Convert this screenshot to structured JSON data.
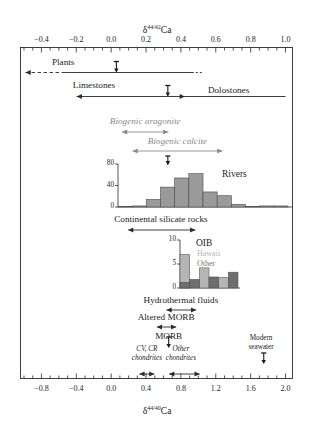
{
  "figure": {
    "top_axis": {
      "title_delta": "δ",
      "title_sup": "44/42",
      "title_elem": "Ca",
      "ticks": [
        "-0.4",
        "-0.2",
        "0.0",
        "0.2",
        "0.4",
        "0.6",
        "0.8",
        "1.0"
      ],
      "tick_values": [
        -0.4,
        -0.2,
        0.0,
        0.2,
        0.4,
        0.6,
        0.8,
        1.0
      ],
      "range": [
        -0.52,
        1.04
      ],
      "minor_per_major": 4
    },
    "bottom_axis": {
      "title_delta": "δ",
      "title_sup": "44/40",
      "title_elem": "Ca",
      "ticks": [
        "-0.8",
        "-0.4",
        "0.0",
        "0.4",
        "0.8",
        "1.2",
        "1.6",
        "2.0"
      ],
      "tick_values": [
        -0.8,
        -0.4,
        0.0,
        0.4,
        0.8,
        1.2,
        1.6,
        2.0
      ],
      "range": [
        -1.04,
        2.08
      ],
      "minor_per_major": 4
    },
    "bars": [
      {
        "name": "plants",
        "label": "Plants",
        "label_x": -0.34,
        "label_align": "left",
        "start": -0.52,
        "end": 0.52,
        "dashed_left": true,
        "arrow_left": true,
        "arrow_right": false,
        "marker": 0.03,
        "style": "plain",
        "italic": false
      },
      {
        "name": "limestones",
        "label": "Limestones",
        "label_x": -0.22,
        "label_align": "left",
        "start": -0.215,
        "end": 0.44,
        "arrow_left": true,
        "arrow_right": true,
        "marker": 0.325,
        "style": "plain",
        "italic": false
      },
      {
        "name": "dolostones",
        "label": "Dolostones",
        "label_x": 0.555,
        "label_align": "left",
        "start": 0.395,
        "end": 1.0,
        "arrow_left": false,
        "arrow_right": false,
        "style": "plain",
        "italic": false
      },
      {
        "name": "biogenic-aragonite",
        "label": "Biogenic aragonite",
        "label_x": 0.195,
        "label_align": "center",
        "start": 0.045,
        "end": 0.345,
        "arrow_left": true,
        "arrow_right": true,
        "style": "grey",
        "italic": true
      },
      {
        "name": "biogenic-calcite",
        "label": "Biogenic calcite",
        "label_x": 0.38,
        "label_align": "center",
        "start": 0.105,
        "end": 0.655,
        "arrow_left": true,
        "arrow_right": true,
        "style": "grey",
        "italic": true
      },
      {
        "name": "continental-silicate-rocks",
        "label": "Continental silicate rocks",
        "label_x": 0.285,
        "label_align": "center",
        "start": 0.08,
        "end": 0.5,
        "arrow_left": true,
        "arrow_right": true,
        "style": "plain",
        "italic": false
      },
      {
        "name": "hydrothermal-fluids",
        "label": "Hydrothermal fluids",
        "label_x": 0.4,
        "label_align": "center",
        "start": 0.3,
        "end": 0.505,
        "arrow_left": true,
        "arrow_right": true,
        "style": "plain",
        "italic": false
      },
      {
        "name": "altered-morb",
        "label": "Altered MORB",
        "label_x": 0.315,
        "label_align": "center",
        "start": 0.245,
        "end": 0.39,
        "arrow_left": true,
        "arrow_right": true,
        "style": "plain",
        "italic": false
      },
      {
        "name": "morb",
        "label": "MORB",
        "label_x": 0.33,
        "label_align": "center",
        "marker": 0.33,
        "style": "marker-only",
        "italic": false
      },
      {
        "name": "modern-seawater",
        "label": "Modern\nseawater",
        "label_x": 0.86,
        "label_align": "center",
        "marker": 0.875,
        "style": "marker-only",
        "italic": false
      },
      {
        "name": "cv-cr-chondrites",
        "label": "CV, CR\nchondrites",
        "label_x": 0.205,
        "label_align": "center",
        "start": 0.145,
        "end": 0.265,
        "arrow_left": true,
        "arrow_right": true,
        "style": "plain",
        "italic": true
      },
      {
        "name": "other-chondrites",
        "label": "Other\nchondrites",
        "label_x": 0.4,
        "label_align": "center",
        "start": 0.315,
        "end": 0.525,
        "arrow_left": true,
        "arrow_right": true,
        "style": "plain",
        "italic": true
      }
    ],
    "rivers_label": "Rivers",
    "oib_label": "OIB",
    "oib_legend": [
      {
        "name": "hawaii",
        "label": "Hawaii",
        "color": "#b3b3b3"
      },
      {
        "name": "other",
        "label": "Other",
        "color": "#777777"
      }
    ]
  },
  "chart_data": [
    {
      "type": "bar",
      "name": "rivers-histogram",
      "title": "Rivers",
      "xlabel": "",
      "ylabel": "",
      "ylim": [
        0,
        80
      ],
      "yticks": [
        0,
        40,
        80
      ],
      "ytick_labels": [
        "0",
        "40",
        "80"
      ],
      "grid": false,
      "legend": "none",
      "x_range": [
        -0.03,
        0.66
      ],
      "bin_width": 0.0575,
      "categories": [
        "-0.03",
        "0.03",
        "0.08",
        "0.14",
        "0.20",
        "0.26",
        "0.31",
        "0.37",
        "0.43",
        "0.49",
        "0.54",
        "0.60"
      ],
      "values": [
        1,
        2,
        14,
        37,
        54,
        62,
        28,
        21,
        5,
        1,
        2,
        2
      ],
      "marker": 0.325,
      "color": "#9a9a9a"
    },
    {
      "type": "bar",
      "name": "oib-histogram",
      "title": "OIB",
      "xlabel": "",
      "ylabel": "",
      "ylim": [
        0,
        10
      ],
      "yticks": [
        0,
        5,
        10
      ],
      "ytick_labels": [
        "0",
        "5",
        "10"
      ],
      "grid": false,
      "legend": "inside",
      "x_range": [
        0.3,
        0.5
      ],
      "bin_width": 0.0335,
      "categories": [
        "0.30",
        "0.33",
        "0.37",
        "0.40",
        "0.43",
        "0.47"
      ],
      "series": [
        {
          "name": "Hawaii",
          "values": [
            7,
            0,
            4.2,
            0,
            2.2,
            0
          ],
          "color": "#b5b5b5"
        },
        {
          "name": "Other",
          "values": [
            1.2,
            1.8,
            0,
            2.3,
            0,
            3.3
          ],
          "color": "#6e6e6e"
        }
      ]
    }
  ]
}
